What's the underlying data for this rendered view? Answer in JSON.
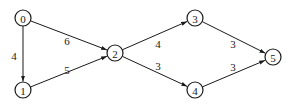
{
  "diagram": {
    "type": "weighted-directed-graph",
    "node_radius": 8,
    "nodes": [
      {
        "id": "0",
        "label": "0",
        "x": 23,
        "y": 18
      },
      {
        "id": "1",
        "label": "1",
        "x": 23,
        "y": 90
      },
      {
        "id": "2",
        "label": "2",
        "x": 115,
        "y": 53
      },
      {
        "id": "3",
        "label": "3",
        "x": 195,
        "y": 18
      },
      {
        "id": "4",
        "label": "4",
        "x": 195,
        "y": 90
      },
      {
        "id": "5",
        "label": "5",
        "x": 273,
        "y": 57
      }
    ],
    "edges": [
      {
        "from": "0",
        "to": "1",
        "weight": "4",
        "label_x": 14,
        "label_y": 56
      },
      {
        "from": "0",
        "to": "2",
        "weight": "6",
        "label_x": 67,
        "label_y": 41
      },
      {
        "from": "1",
        "to": "2",
        "weight": "5",
        "label_x": 67,
        "label_y": 70
      },
      {
        "from": "2",
        "to": "3",
        "weight": "4",
        "label_x": 158,
        "label_y": 44
      },
      {
        "from": "2",
        "to": "4",
        "weight": "3",
        "label_x": 158,
        "label_y": 66
      },
      {
        "from": "3",
        "to": "5",
        "weight": "3",
        "label_x": 233,
        "label_y": 44
      },
      {
        "from": "4",
        "to": "5",
        "weight": "3",
        "label_x": 233,
        "label_y": 67
      }
    ]
  }
}
